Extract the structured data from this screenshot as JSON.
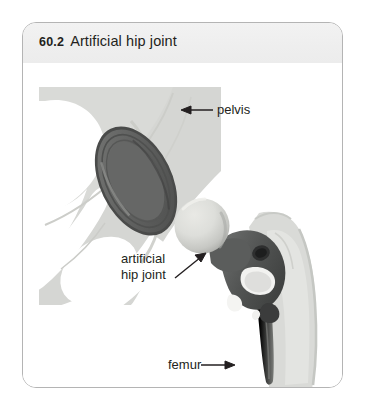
{
  "figure": {
    "number": "60.2",
    "title": "Artificial hip joint"
  },
  "labels": {
    "pelvis": "pelvis",
    "artificial_hip_joint_line1": "artificial",
    "artificial_hip_joint_line2": "hip joint",
    "femur": "femur"
  },
  "icons": {
    "arrow_pelvis": "arrow-left-icon",
    "arrow_hip_joint": "arrow-up-right-icon",
    "arrow_femur": "arrow-right-icon"
  },
  "colors": {
    "frame_border": "#b4b4b4",
    "title_band": "#efefef",
    "text": "#231f20",
    "bone_light": "#d9dad7",
    "bone_mid": "#c8cac6",
    "bone_shadow": "#bcbeb9",
    "cup_dark": "#5d5e5d",
    "cup_mid": "#6e6f6e",
    "cup_rim": "#4a4b4a",
    "ball_light": "#dcdcd8",
    "ball_shade": "#b9bab6",
    "stem_dark": "#4f5150",
    "stem_mid": "#6a6c6b",
    "stem_shaft": "#8a8c89",
    "background": "#ffffff"
  }
}
